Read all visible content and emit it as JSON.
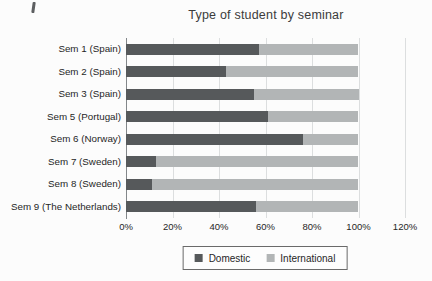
{
  "chart_data": {
    "type": "bar",
    "variant": "horizontal-stacked-100",
    "title": "Type of student by seminar",
    "categories": [
      "Sem 1 (Spain)",
      "Sem 2 (Spain)",
      "Sem 3 (Spain)",
      "Sem 5 (Portugal)",
      "Sem 6 (Norway)",
      "Sem 7 (Sweden)",
      "Sem 8 (Sweden)",
      "Sem 9 (The Netherlands)"
    ],
    "series": [
      {
        "name": "Domestic",
        "color": "#56595b",
        "values": [
          57,
          43,
          55,
          61,
          76,
          13,
          11,
          56
        ]
      },
      {
        "name": "International",
        "color": "#b2b5b6",
        "values": [
          43,
          57,
          45,
          39,
          24,
          87,
          89,
          44
        ]
      }
    ],
    "x_axis": {
      "unit": "%",
      "tick_values": [
        0,
        20,
        40,
        60,
        80,
        100,
        120
      ],
      "tick_labels": [
        "0%",
        "20%",
        "40%",
        "60%",
        "80%",
        "100%",
        "120%"
      ],
      "max": 120
    },
    "legend": {
      "position": "bottom",
      "labels": [
        "Domestic",
        "International"
      ]
    },
    "grid": "vertical",
    "colors": {
      "grid": "#dcdedf",
      "axis": "#83878a",
      "text": "#262626",
      "title_text": "#3b3b3b",
      "legend_border": "#6a6a6a",
      "background": "#fcfcfc"
    }
  }
}
